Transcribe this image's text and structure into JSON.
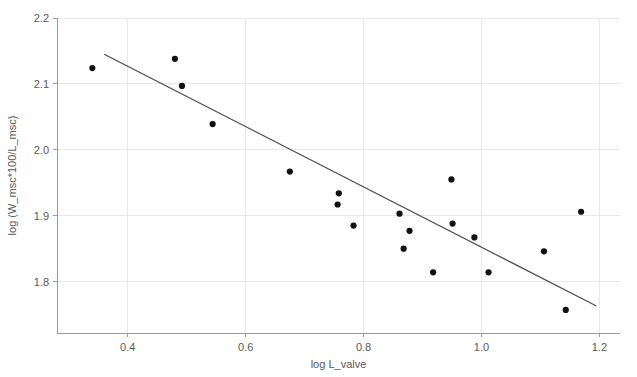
{
  "chart_data": {
    "type": "scatter",
    "title": "",
    "xlabel": "log L_valve",
    "ylabel": "log (W_msc*100/L_msc)",
    "xlim": [
      0.28,
      1.235
    ],
    "ylim": [
      1.722,
      2.2
    ],
    "xticks": [
      0.4,
      0.6,
      0.8,
      1.0,
      1.2
    ],
    "xtick_labels": [
      "0.4",
      "0.6",
      "0.8",
      "1.0",
      "1.2"
    ],
    "yticks": [
      1.8,
      1.9,
      2.0,
      2.1,
      2.2
    ],
    "ytick_labels": [
      "1.8",
      "1.9",
      "2.0",
      "2.1",
      "2.2"
    ],
    "grid": true,
    "legend": "none",
    "point_color": "#111111",
    "line_color": "#4a4a4c",
    "grid_color": "#e8e8ea",
    "axis_color": "#9a9a9c",
    "text_color": "#58585a",
    "points": [
      {
        "x": 0.34,
        "y": 2.124
      },
      {
        "x": 0.48,
        "y": 2.138
      },
      {
        "x": 0.492,
        "y": 2.097
      },
      {
        "x": 0.544,
        "y": 2.039
      },
      {
        "x": 0.675,
        "y": 1.967
      },
      {
        "x": 0.758,
        "y": 1.934
      },
      {
        "x": 0.756,
        "y": 1.917
      },
      {
        "x": 0.783,
        "y": 1.885
      },
      {
        "x": 0.861,
        "y": 1.903
      },
      {
        "x": 0.878,
        "y": 1.877
      },
      {
        "x": 0.868,
        "y": 1.85
      },
      {
        "x": 0.918,
        "y": 1.814
      },
      {
        "x": 0.949,
        "y": 1.955
      },
      {
        "x": 0.951,
        "y": 1.888
      },
      {
        "x": 0.988,
        "y": 1.867
      },
      {
        "x": 1.012,
        "y": 1.814
      },
      {
        "x": 1.106,
        "y": 1.846
      },
      {
        "x": 1.143,
        "y": 1.757
      },
      {
        "x": 1.169,
        "y": 1.906
      }
    ],
    "fit_line": {
      "x_start": 0.36,
      "y_start": 2.145,
      "x_end": 1.195,
      "y_end": 1.763
    }
  }
}
